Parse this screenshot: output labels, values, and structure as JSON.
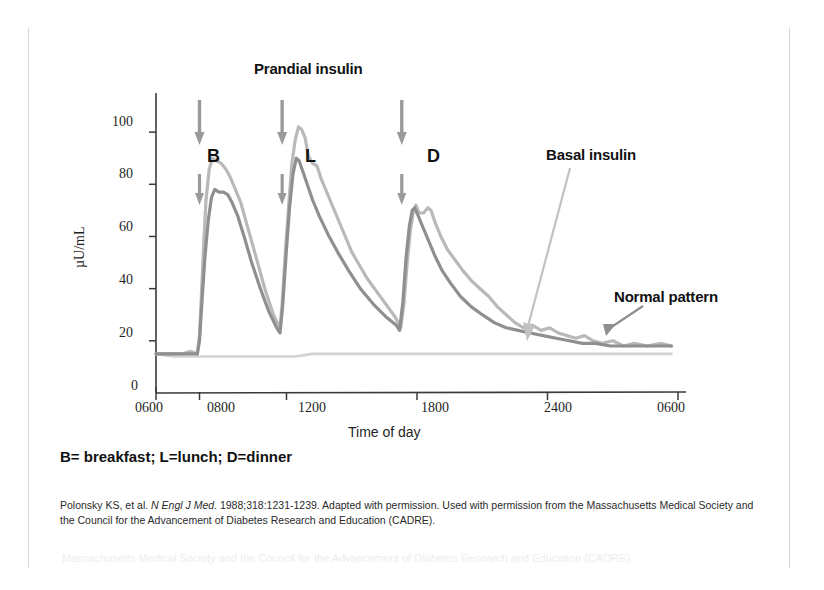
{
  "figure": {
    "title_annotation": "Prandial insulin",
    "y_axis_label": "µU/mL",
    "x_axis_label": "Time of day",
    "annotations": [
      {
        "name": "basal-insulin",
        "text": "Basal insulin"
      },
      {
        "name": "normal-pattern",
        "text": "Normal pattern"
      }
    ],
    "meal_markers": [
      {
        "letter": "B",
        "time": "0800"
      },
      {
        "letter": "L",
        "time": "1200"
      },
      {
        "letter": "D",
        "time": "1730"
      }
    ],
    "legend_note": "B= breakfast; L=lunch; D=dinner",
    "citation_line1_pre": "Polonsky KS, et al. ",
    "citation_journal": "N Engl J Med",
    "citation_line1_post": ". 1988;318:1231-1239. Adapted with permission. Used with permission from the",
    "citation_line2": "Massachusetts Medical Society and the Council for the Advancement of Diabetes Research and Education (CADRE).",
    "ghost_text": "Massachusetts Medical Society and the Council for the Advancement of Diabetes Research and Education (CADRE).",
    "colors": {
      "curve_light": "#b9b9b9",
      "curve_dark": "#8f8f8f",
      "basal_flat": "#d2d2d2",
      "axis": "#3a3a3a",
      "arrow": "#9a9a9a",
      "text": "#111111"
    }
  },
  "chart_data": {
    "type": "line",
    "title": "Prandial insulin",
    "xlabel": "Time of day",
    "ylabel": "µU/mL",
    "xlim": [
      600,
      3000
    ],
    "ylim": [
      0,
      115
    ],
    "yticks": [
      0,
      20,
      40,
      60,
      80,
      100
    ],
    "xticks": [
      600,
      800,
      1200,
      1800,
      2400,
      3000
    ],
    "xticklabels": [
      "0600",
      "0800",
      "1200",
      "1800",
      "2400",
      "0600"
    ],
    "grid": false,
    "legend_position": "annotations-inline",
    "annotations": [
      {
        "label": "Prandial insulin",
        "x": 1150,
        "y": 112
      },
      {
        "label": "Basal insulin",
        "x": 2150,
        "y": 78,
        "points_to": {
          "x": 2270,
          "y": 26
        }
      },
      {
        "label": "Normal pattern",
        "x": 2640,
        "y": 43,
        "points_to": {
          "x": 2520,
          "y": 27
        }
      },
      {
        "label": "B",
        "x": 800,
        "y": 84
      },
      {
        "label": "L",
        "x": 1180,
        "y": 84
      },
      {
        "label": "D",
        "x": 1730,
        "y": 84
      }
    ],
    "series": [
      {
        "name": "Insulin secretion profile (light)",
        "color": "#b9b9b9",
        "points": [
          [
            600,
            15
          ],
          [
            660,
            15
          ],
          [
            720,
            15
          ],
          [
            760,
            16
          ],
          [
            790,
            15
          ],
          [
            800,
            22
          ],
          [
            810,
            40
          ],
          [
            820,
            58
          ],
          [
            830,
            74
          ],
          [
            845,
            86
          ],
          [
            860,
            90
          ],
          [
            880,
            89
          ],
          [
            900,
            88
          ],
          [
            920,
            86
          ],
          [
            940,
            83
          ],
          [
            960,
            79
          ],
          [
            990,
            73
          ],
          [
            1020,
            64
          ],
          [
            1060,
            52
          ],
          [
            1100,
            40
          ],
          [
            1140,
            30
          ],
          [
            1170,
            25
          ],
          [
            1180,
            34
          ],
          [
            1195,
            54
          ],
          [
            1210,
            72
          ],
          [
            1225,
            88
          ],
          [
            1240,
            97
          ],
          [
            1255,
            102
          ],
          [
            1270,
            101
          ],
          [
            1285,
            98
          ],
          [
            1300,
            91
          ],
          [
            1320,
            88
          ],
          [
            1340,
            87
          ],
          [
            1360,
            82
          ],
          [
            1400,
            74
          ],
          [
            1450,
            64
          ],
          [
            1500,
            54
          ],
          [
            1570,
            44
          ],
          [
            1640,
            36
          ],
          [
            1700,
            29
          ],
          [
            1725,
            25
          ],
          [
            1740,
            34
          ],
          [
            1755,
            50
          ],
          [
            1770,
            63
          ],
          [
            1785,
            70
          ],
          [
            1795,
            72
          ],
          [
            1810,
            69
          ],
          [
            1830,
            69
          ],
          [
            1850,
            71
          ],
          [
            1865,
            70
          ],
          [
            1885,
            65
          ],
          [
            1910,
            60
          ],
          [
            1940,
            55
          ],
          [
            1975,
            51
          ],
          [
            2010,
            47
          ],
          [
            2050,
            43
          ],
          [
            2090,
            40
          ],
          [
            2130,
            37
          ],
          [
            2170,
            33
          ],
          [
            2210,
            30
          ],
          [
            2250,
            27
          ],
          [
            2290,
            25
          ],
          [
            2330,
            26
          ],
          [
            2370,
            24
          ],
          [
            2410,
            25
          ],
          [
            2450,
            23
          ],
          [
            2490,
            22
          ],
          [
            2530,
            21
          ],
          [
            2570,
            22
          ],
          [
            2610,
            20
          ],
          [
            2650,
            19
          ],
          [
            2700,
            20
          ],
          [
            2750,
            18
          ],
          [
            2800,
            19
          ],
          [
            2860,
            18
          ],
          [
            2920,
            19
          ],
          [
            2970,
            18
          ]
        ]
      },
      {
        "name": "Insulin secretion profile (dark)",
        "color": "#8f8f8f",
        "points": [
          [
            600,
            15
          ],
          [
            680,
            15
          ],
          [
            750,
            15
          ],
          [
            790,
            15
          ],
          [
            800,
            20
          ],
          [
            812,
            36
          ],
          [
            825,
            52
          ],
          [
            840,
            66
          ],
          [
            855,
            75
          ],
          [
            870,
            78
          ],
          [
            890,
            77
          ],
          [
            910,
            77
          ],
          [
            930,
            76
          ],
          [
            950,
            73
          ],
          [
            975,
            68
          ],
          [
            1005,
            60
          ],
          [
            1040,
            50
          ],
          [
            1080,
            40
          ],
          [
            1120,
            31
          ],
          [
            1155,
            25
          ],
          [
            1170,
            23
          ],
          [
            1182,
            33
          ],
          [
            1198,
            53
          ],
          [
            1214,
            71
          ],
          [
            1230,
            84
          ],
          [
            1245,
            90
          ],
          [
            1258,
            89
          ],
          [
            1275,
            85
          ],
          [
            1295,
            80
          ],
          [
            1320,
            74
          ],
          [
            1350,
            68
          ],
          [
            1390,
            61
          ],
          [
            1435,
            54
          ],
          [
            1485,
            47
          ],
          [
            1540,
            40
          ],
          [
            1600,
            34
          ],
          [
            1660,
            29
          ],
          [
            1705,
            26
          ],
          [
            1720,
            24
          ],
          [
            1735,
            35
          ],
          [
            1750,
            52
          ],
          [
            1765,
            64
          ],
          [
            1778,
            70
          ],
          [
            1790,
            71
          ],
          [
            1805,
            68
          ],
          [
            1825,
            64
          ],
          [
            1850,
            59
          ],
          [
            1880,
            53
          ],
          [
            1915,
            47
          ],
          [
            1955,
            42
          ],
          [
            2000,
            37
          ],
          [
            2050,
            33
          ],
          [
            2100,
            30
          ],
          [
            2155,
            27
          ],
          [
            2210,
            25
          ],
          [
            2265,
            24
          ],
          [
            2320,
            23
          ],
          [
            2380,
            22
          ],
          [
            2440,
            21
          ],
          [
            2500,
            20
          ],
          [
            2560,
            19
          ],
          [
            2620,
            19
          ],
          [
            2690,
            18
          ],
          [
            2760,
            18
          ],
          [
            2830,
            18
          ],
          [
            2900,
            18
          ],
          [
            2970,
            18
          ]
        ]
      },
      {
        "name": "Normal basal pattern (flat)",
        "color": "#d2d2d2",
        "points": [
          [
            600,
            15
          ],
          [
            680,
            14
          ],
          [
            760,
            14
          ],
          [
            840,
            14
          ],
          [
            920,
            14
          ],
          [
            1000,
            14
          ],
          [
            1080,
            14
          ],
          [
            1160,
            14
          ],
          [
            1240,
            14
          ],
          [
            1320,
            15
          ],
          [
            1400,
            15
          ],
          [
            1480,
            15
          ],
          [
            1560,
            15
          ],
          [
            1640,
            15
          ],
          [
            1720,
            15
          ],
          [
            1800,
            15
          ],
          [
            1880,
            15
          ],
          [
            1960,
            15
          ],
          [
            2040,
            15
          ],
          [
            2120,
            15
          ],
          [
            2200,
            15
          ],
          [
            2280,
            15
          ],
          [
            2360,
            15
          ],
          [
            2440,
            15
          ],
          [
            2520,
            15
          ],
          [
            2600,
            15
          ],
          [
            2680,
            15
          ],
          [
            2760,
            15
          ],
          [
            2840,
            15
          ],
          [
            2920,
            15
          ],
          [
            2970,
            15
          ]
        ]
      }
    ]
  }
}
